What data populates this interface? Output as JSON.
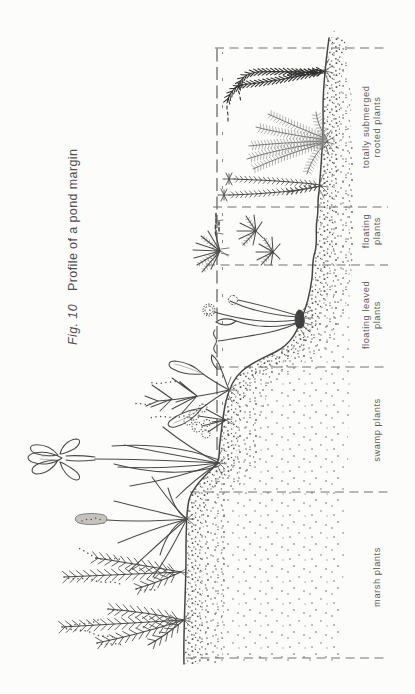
{
  "figure": {
    "fig_label": "Fig. 10",
    "title": "Profile of a pond margin",
    "zones": [
      {
        "name": "marsh",
        "lines": [
          "marsh plants"
        ]
      },
      {
        "name": "swamp",
        "lines": [
          "swamp plants"
        ]
      },
      {
        "name": "floating-leaved",
        "lines": [
          "floating leaved",
          "plants"
        ]
      },
      {
        "name": "floating",
        "lines": [
          "floating",
          "plants"
        ]
      },
      {
        "name": "totally-submerged",
        "lines": [
          "totally submerged",
          "rooted plants"
        ]
      }
    ],
    "colors": {
      "ink": "#4a4a4a",
      "paper": "#fcfcfa",
      "label_text": "#5c5c5c"
    }
  }
}
